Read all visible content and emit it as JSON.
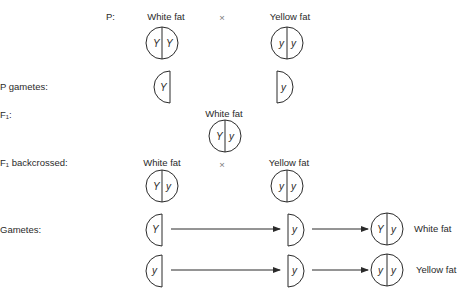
{
  "rows": {
    "p": {
      "label": "P:",
      "left_phenotype": "White fat",
      "cross_symbol": "×",
      "right_phenotype": "Yellow fat",
      "left_genotype": [
        "Y",
        "Y"
      ],
      "right_genotype": [
        "y",
        "y"
      ]
    },
    "p_gametes": {
      "label": "P gametes:",
      "left_allele": "Y",
      "right_allele": "y"
    },
    "f1": {
      "label": "F₁:",
      "phenotype": "White fat",
      "genotype": [
        "Y",
        "y"
      ]
    },
    "f1_backcrossed": {
      "label": "F₁ backcrossed:",
      "left_phenotype": "White fat",
      "cross_symbol": "×",
      "right_phenotype": "Yellow fat",
      "left_genotype": [
        "Y",
        "y"
      ],
      "right_genotype": [
        "y",
        "y"
      ]
    },
    "gametes": {
      "label": "Gametes:",
      "combinations": [
        {
          "f1_gamete": "Y",
          "yellow_gamete": "y",
          "offspring_genotype": [
            "Y",
            "y"
          ],
          "offspring_phenotype": "White fat"
        },
        {
          "f1_gamete": "y",
          "yellow_gamete": "y",
          "offspring_genotype": [
            "y",
            "y"
          ],
          "offspring_phenotype": "Yellow fat"
        }
      ]
    }
  },
  "colors": {
    "ink": "#2a2a2a",
    "background": "#ffffff"
  }
}
